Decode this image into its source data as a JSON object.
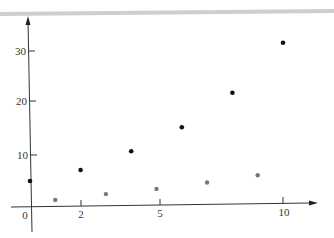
{
  "chart_data": {
    "type": "scatter",
    "title": "",
    "xlabel": "",
    "ylabel": "",
    "xlim": [
      -1,
      11.5
    ],
    "ylim": [
      -5,
      36
    ],
    "grid": false,
    "legend": null,
    "x_ticks": [
      0,
      2,
      5,
      10
    ],
    "x_tick_labels": [
      "0",
      "2",
      "5",
      "10"
    ],
    "y_ticks": [
      10,
      20,
      30
    ],
    "y_tick_labels": [
      "10",
      "20",
      "30"
    ],
    "series": [
      {
        "name": "black points",
        "color": "#111111",
        "x": [
          0,
          2,
          4,
          6,
          8,
          10
        ],
        "y": [
          5,
          7,
          10.5,
          15,
          21.5,
          31
        ]
      },
      {
        "name": "gray points",
        "color": "#777777",
        "x": [
          1,
          3,
          5,
          7,
          9
        ],
        "y": [
          1.3,
          2.3,
          3.2,
          4.3,
          5.6
        ]
      }
    ]
  },
  "axes": {
    "x_labels": {
      "t0": "0",
      "t2": "2",
      "t5": "5",
      "t10": "10"
    },
    "y_labels": {
      "t10": "10",
      "t20": "20",
      "t30": "30"
    }
  },
  "colors": {
    "axis": "#333333",
    "top_band": "#c8c8c8"
  }
}
